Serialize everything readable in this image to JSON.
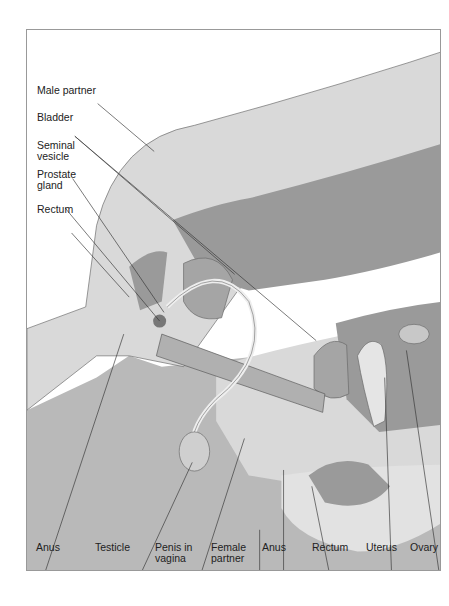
{
  "figure": {
    "colors": {
      "light": "#d9d9d9",
      "mid": "#b9b9b9",
      "dark": "#9a9a9a",
      "darker": "#8a8a8a",
      "outline": "#555555",
      "leader": "#333333"
    },
    "left_labels": [
      {
        "id": "male-partner",
        "text": "Male partner"
      },
      {
        "id": "bladder-male",
        "text": "Bladder"
      },
      {
        "id": "seminal-vesicle",
        "text": "Seminal vesicle"
      },
      {
        "id": "prostate-gland",
        "text": "Prostate gland"
      },
      {
        "id": "rectum-male",
        "text": "Rectum"
      }
    ],
    "bottom_labels": [
      {
        "id": "anus-male",
        "text": "Anus"
      },
      {
        "id": "testicle",
        "text": "Testicle"
      },
      {
        "id": "penis-in-vagina",
        "text": "Penis in vagina"
      },
      {
        "id": "female-partner",
        "text": "Female partner"
      },
      {
        "id": "anus-female",
        "text": "Anus"
      },
      {
        "id": "rectum-female",
        "text": "Rectum"
      },
      {
        "id": "uterus",
        "text": "Uterus"
      },
      {
        "id": "ovary",
        "text": "Ovary"
      }
    ]
  }
}
